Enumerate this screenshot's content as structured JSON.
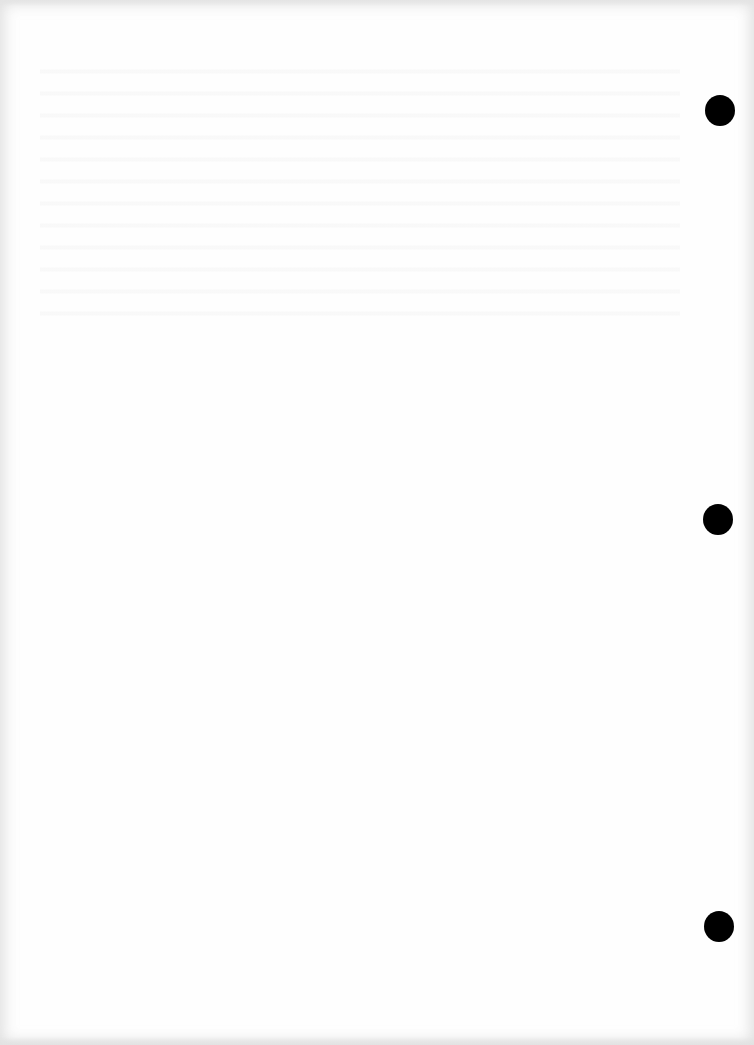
{
  "document": {
    "type": "blank-scanned-page",
    "background_color": "#fefefe",
    "text_content": "",
    "punch_holes": [
      {
        "position": "top",
        "cx": 720,
        "cy": 110,
        "color": "#000000"
      },
      {
        "position": "middle",
        "cx": 718,
        "cy": 519,
        "color": "#000000"
      },
      {
        "position": "bottom",
        "cx": 719,
        "cy": 926,
        "color": "#000000"
      }
    ]
  }
}
